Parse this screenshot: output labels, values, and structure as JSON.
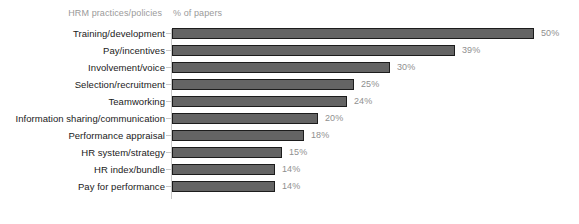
{
  "header": {
    "category_header": "HRM practices/policies",
    "value_header": "% of papers"
  },
  "chart_data": {
    "type": "bar",
    "orientation": "horizontal",
    "title": "",
    "subtitle": "",
    "xlabel": "% of papers",
    "ylabel": "HRM practices/policies",
    "grid": false,
    "legend": false,
    "xlim": [
      0,
      50
    ],
    "value_suffix": "%",
    "categories": [
      "Training/development",
      "Pay/incentives",
      "Involvement/voice",
      "Selection/recruitment",
      "Teamworking",
      "Information sharing/communication",
      "Performance appraisal",
      "HR system/strategy",
      "HR index/bundle",
      "Pay for performance"
    ],
    "values": [
      50,
      39,
      30,
      25,
      24,
      20,
      18,
      15,
      14,
      14
    ],
    "value_labels": [
      "50%",
      "39%",
      "30%",
      "25%",
      "24%",
      "20%",
      "18%",
      "15%",
      "14%",
      "14%"
    ],
    "colors": {
      "bar_fill": "#646464",
      "bar_border": "#1c1c1c",
      "axis": "#c9c9c9",
      "value_label": "#8f8f8f",
      "category_label": "#1a1a1a",
      "header_label": "#9a9a9a",
      "background": "#ffffff"
    }
  },
  "rows": [
    {
      "label": "Training/development",
      "value": 50,
      "value_label": "50%"
    },
    {
      "label": "Pay/incentives",
      "value": 39,
      "value_label": "39%"
    },
    {
      "label": "Involvement/voice",
      "value": 30,
      "value_label": "30%"
    },
    {
      "label": "Selection/recruitment",
      "value": 25,
      "value_label": "25%"
    },
    {
      "label": "Teamworking",
      "value": 24,
      "value_label": "24%"
    },
    {
      "label": "Information sharing/communication",
      "value": 20,
      "value_label": "20%"
    },
    {
      "label": "Performance appraisal",
      "value": 18,
      "value_label": "18%"
    },
    {
      "label": "HR system/strategy",
      "value": 15,
      "value_label": "15%"
    },
    {
      "label": "HR index/bundle",
      "value": 14,
      "value_label": "14%"
    },
    {
      "label": "Pay for performance",
      "value": 14,
      "value_label": "14%"
    }
  ]
}
